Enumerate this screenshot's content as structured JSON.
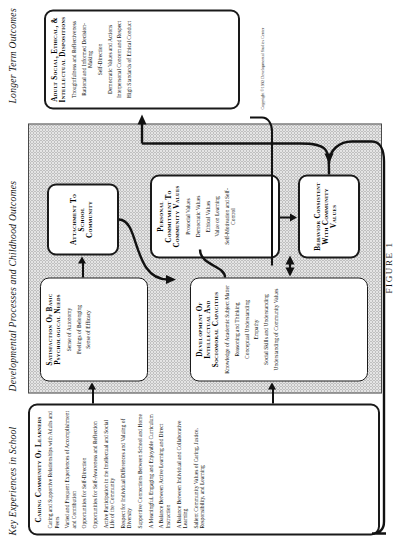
{
  "figure": {
    "label": "FIGURE 1",
    "copyright": "Copyright ©1992 Developmental Studies Center"
  },
  "column_headers": [
    {
      "id": "key-experiences",
      "text": "Key Experiences in School"
    },
    {
      "id": "developmental-processes",
      "text": "Developmental Processes and Childhood Outcomes"
    },
    {
      "id": "longer-term",
      "text": "Longer Term Outcomes"
    }
  ],
  "boxes": {
    "caring_community": {
      "title": "Caring Community of Learners",
      "items": [
        "Caring and Supportive Relationships with Adults and Peers",
        "Varied and Frequent Experiences of Accomplishment and Contribution",
        "Opportunities for Self-Direction",
        "Opportunities for Self-Awareness and Reflection",
        "Active Participation in the Intellectual and Social Life of the Community",
        "Respect for Individual Differences and Valuing of Diversity",
        "Supportive Connections Between School and Home",
        "A Meaningful, Engaging and Enjoyable Curriculum",
        "A Balance Between Active Learning and Direct Instruction",
        "A Balance Between Individual and Collaborative Learning",
        "Salient Community Values of Caring, Justice, Responsibility, and Learning"
      ]
    },
    "basic_needs": {
      "title": "Satisfaction of Basic Psychological Needs",
      "items": [
        "Sense of Autonomy",
        "Feelings of Belonging",
        "Sense of Efficacy"
      ]
    },
    "capacities": {
      "title": "Development of Intellectual and Sociomoral Capacities",
      "items": [
        "Knowledge of Academic Subject Matter",
        "Reasoning and Thinking",
        "Conceptual Understanding",
        "Empathy",
        "Social Skills and Understanding",
        "Understanding of Community Values"
      ]
    },
    "attachment": {
      "title": "Attachment to School Community",
      "items": []
    },
    "personal_commitment": {
      "title": "Personal Commitment to Community Values",
      "items": [
        "Prosocial Values",
        "Democratic Values",
        "Ethical Values",
        "Value on Learning",
        "Self-Motivation and Self-Control"
      ]
    },
    "behavior": {
      "title": "Behavior Consistent with Community Values",
      "items": []
    },
    "adult_dispositions": {
      "title": "Adult Social, Ethical, & Intellectual Dispositions",
      "items": [
        "Thoughtfulness and Reflectiveness",
        "Rational and Informed Decision-Making",
        "Self-Direction",
        "Democratic Values and Actions",
        "Interpersonal Concern and Respect",
        "High Standards of Ethical Conduct"
      ]
    }
  },
  "colors": {
    "panel_fill": "#e4e4e4",
    "stroke": "#1a1a1a",
    "page": "#ffffff"
  }
}
